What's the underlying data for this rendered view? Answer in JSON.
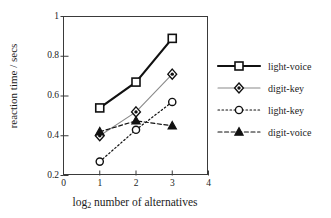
{
  "chart_data": {
    "type": "line",
    "title": "",
    "xlabel": "log2 number of alternatives",
    "xlabel_base": "log",
    "xlabel_sub": "2",
    "xlabel_rest": " number of alternatives",
    "ylabel": "reaction time / secs",
    "x": [
      1,
      2,
      3
    ],
    "xlim": [
      0,
      4
    ],
    "ylim": [
      0.2,
      1
    ],
    "xticks": [
      "0",
      "1",
      "2",
      "3",
      "4"
    ],
    "xtick_values": [
      0,
      1,
      2,
      3,
      4
    ],
    "yticks": [
      "0.2",
      "0.4",
      "0.6",
      "0.8",
      "1"
    ],
    "ytick_values": [
      0.2,
      0.4,
      0.6,
      0.8,
      1
    ],
    "grid": false,
    "legend_position": "right",
    "series": [
      {
        "name": "light-voice",
        "values": [
          0.54,
          0.67,
          0.89
        ],
        "marker": "square-open",
        "linestyle": "solid",
        "color": "#111111",
        "linewidth": 2.2
      },
      {
        "name": "digit-key",
        "values": [
          0.4,
          0.52,
          0.71
        ],
        "marker": "diamond-filled-center",
        "linestyle": "solid",
        "color": "#8a8a8a",
        "linewidth": 1.1
      },
      {
        "name": "light-key",
        "values": [
          0.27,
          0.43,
          0.57
        ],
        "marker": "circle-open",
        "linestyle": "dotted",
        "color": "#111111",
        "linewidth": 1.2
      },
      {
        "name": "digit-voice",
        "values": [
          0.42,
          0.475,
          0.45
        ],
        "marker": "triangle-filled",
        "linestyle": "dashed",
        "color": "#111111",
        "linewidth": 1.2
      }
    ]
  }
}
